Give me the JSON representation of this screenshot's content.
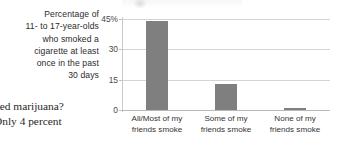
{
  "caption": {
    "lines": [
      "Percentage of",
      "11- to 17-year-olds",
      "who smoked a",
      "cigarette at least",
      "once in the past",
      "30 days"
    ]
  },
  "body_text": {
    "lines": [
      "ked marijuana?",
      "Only 4 percent"
    ]
  },
  "colors": {
    "bar": "#807f80",
    "gridline": "#d4d4d4",
    "axis": "#c0c0c0",
    "text": "#333333"
  },
  "chart_data": {
    "type": "bar",
    "title": "",
    "categories": [
      "All/Most of my friends smoke",
      "Some of my friends smoke",
      "None of my friends smoke"
    ],
    "category_lines": [
      [
        "All/Most of my",
        "friends smoke"
      ],
      [
        "Some of my",
        "friends smoke"
      ],
      [
        "None of my",
        "friends smoke"
      ]
    ],
    "values": [
      44,
      13,
      1
    ],
    "xlabel": "",
    "ylabel": "Percentage of 11- to 17-year-olds who smoked a cigarette at least once in the past 30 days",
    "ylim": [
      0,
      45
    ],
    "yticks": [
      0,
      15,
      30,
      45
    ],
    "ytick_labels": [
      "0",
      "15",
      "30",
      "45%"
    ],
    "grid": true,
    "legend": "none"
  }
}
